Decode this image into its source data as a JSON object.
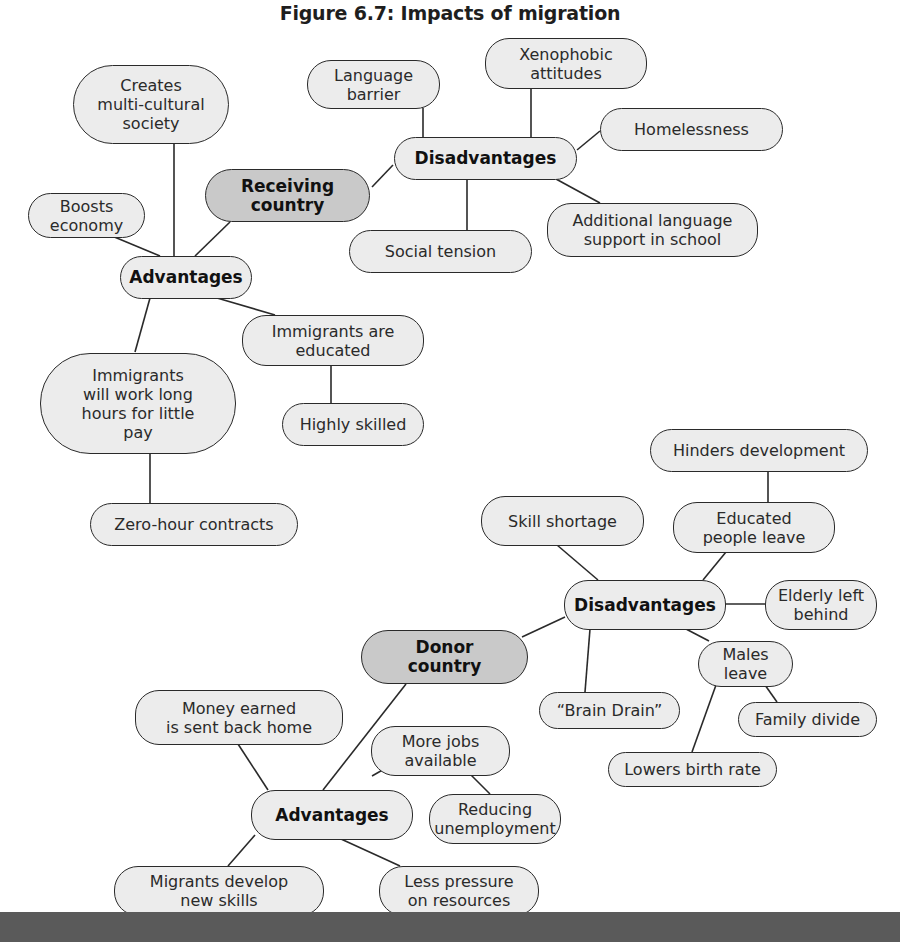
{
  "title": "Figure 6.7: Impacts of migration",
  "colors": {
    "node_fill": "#ececec",
    "root_fill": "#c9c9c9",
    "stroke": "#2a2a2a",
    "footer_bar": "#5a5a5a"
  },
  "nodes": {
    "receiving": "Receiving\ncountry",
    "recv_adv": "Advantages",
    "recv_dis": "Disadvantages",
    "multicultural": "Creates\nmulti-cultural\nsociety",
    "boosts": "Boosts\neconomy",
    "immig_work": "Immigrants\nwill work long\nhours for little\npay",
    "zero_hour": "Zero-hour contracts",
    "immig_edu": "Immigrants are\neducated",
    "highly_skilled": "Highly skilled",
    "lang_barrier": "Language\nbarrier",
    "xenophobic": "Xenophobic\nattitudes",
    "homelessness": "Homelessness",
    "social_tension": "Social tension",
    "add_lang": "Additional language\nsupport in school",
    "donor": "Donor\ncountry",
    "donor_dis": "Disadvantages",
    "donor_adv": "Advantages",
    "hinders": "Hinders development",
    "educated_leave": "Educated\npeople leave",
    "skill_shortage": "Skill shortage",
    "elderly": "Elderly left\nbehind",
    "males_leave": "Males\nleave",
    "brain_drain": "“Brain Drain”",
    "family_divide": "Family divide",
    "birth_rate": "Lowers birth rate",
    "money_home": "Money earned\nis sent back home",
    "more_jobs": "More jobs\navailable",
    "reducing_unemp": "Reducing\nunemployment",
    "develop_skills": "Migrants develop\nnew skills",
    "less_pressure": "Less pressure\non resources"
  }
}
